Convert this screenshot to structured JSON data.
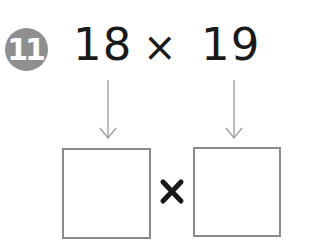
{
  "problem": {
    "number": "11",
    "left_operand": "18",
    "operator": "×",
    "right_operand": "19"
  },
  "answer_boxes": [
    {
      "value": ""
    },
    {
      "value": ""
    }
  ],
  "answer_operator": "×",
  "colors": {
    "badge": "#8f8f8f",
    "text": "#1a1a1a",
    "arrow": "#9a9a9a",
    "box_border": "#8a8a8a"
  }
}
